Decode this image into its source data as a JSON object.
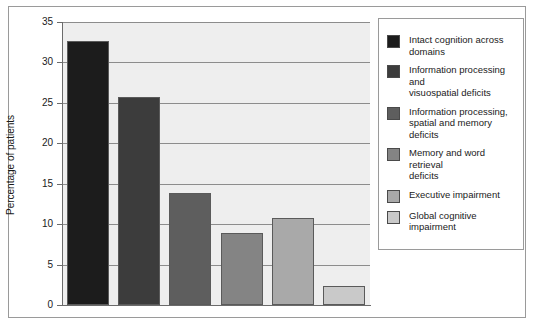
{
  "chart_data": {
    "type": "bar",
    "title": "",
    "xlabel": "",
    "ylabel": "Percentage of patients",
    "ylim": [
      0,
      35
    ],
    "ytick_labels": [
      "35",
      "30",
      "25",
      "20",
      "15",
      "10",
      "5",
      "0"
    ],
    "ytick_values": [
      35,
      30,
      25,
      20,
      15,
      10,
      5,
      0
    ],
    "grid": true,
    "legend_position": "right",
    "categories": [
      "Intact cognition across domains",
      "Information processing and visuospatial deficits",
      "Information processing, spatial and memory deficits",
      "Memory and word retrieval deficits",
      "Executive impairment",
      "Global cognitive impairment"
    ],
    "values": [
      32.6,
      25.7,
      13.8,
      8.9,
      10.7,
      2.3
    ],
    "colors": [
      "#1c1c1c",
      "#3c3c3c",
      "#5e5e5e",
      "#848484",
      "#a9a9a9",
      "#c9c9c9"
    ]
  },
  "legend": {
    "items": [
      {
        "label": "Intact cognition across domains",
        "color": "#1c1c1c"
      },
      {
        "label": "Information processing and\nvisuospatial deficits",
        "color": "#3c3c3c"
      },
      {
        "label": "Information processing,\nspatial and memory deficits",
        "color": "#5e5e5e"
      },
      {
        "label": "Memory and word retrieval\ndeficits",
        "color": "#848484"
      },
      {
        "label": "Executive impairment",
        "color": "#a9a9a9"
      },
      {
        "label": "Global cognitive impairment",
        "color": "#c9c9c9"
      }
    ]
  }
}
